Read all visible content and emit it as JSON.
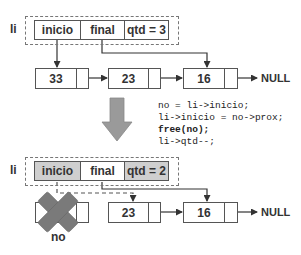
{
  "before": {
    "list_label": "li",
    "fields": [
      {
        "label": "inicio",
        "highlighted": false
      },
      {
        "label": "final",
        "highlighted": false
      },
      {
        "label": "qtd = 3",
        "highlighted": false
      }
    ],
    "nodes": [
      {
        "value": "33"
      },
      {
        "value": "23"
      },
      {
        "value": "16"
      }
    ],
    "terminator": "NULL"
  },
  "code": {
    "lines": [
      "no = li->inicio;",
      "li->inicio = no->prox;",
      "free(no);",
      "li->qtd--;"
    ]
  },
  "after": {
    "list_label": "li",
    "fields": [
      {
        "label": "inicio",
        "highlighted": true
      },
      {
        "label": "final",
        "highlighted": false
      },
      {
        "label": "qtd = 2",
        "highlighted": true
      }
    ],
    "removed_node_label": "no",
    "nodes": [
      {
        "value": "23"
      },
      {
        "value": "16"
      }
    ],
    "terminator": "NULL"
  },
  "colors": {
    "outline": "#555555",
    "highlight_fill": "#cfcfcf",
    "arrow_fill": "#9a9a9a",
    "x_fill": "#7a7a7a"
  }
}
